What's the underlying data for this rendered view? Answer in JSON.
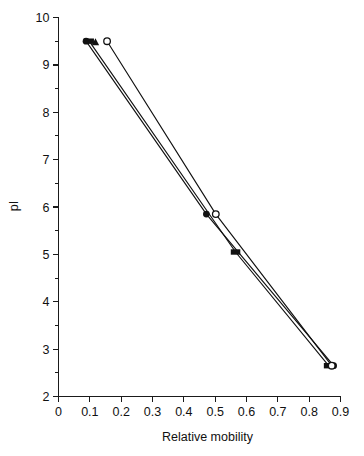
{
  "chart_data": {
    "type": "line",
    "title": "",
    "subtitle": "",
    "xlabel": "Relative mobility",
    "ylabel": "pI",
    "xlim": [
      0,
      0.9
    ],
    "ylim": [
      2,
      10
    ],
    "grid": false,
    "legend": "none",
    "x_ticks": [
      "0",
      "0.1",
      "0.2",
      "0.3",
      "0.4",
      "0.5",
      "0.6",
      "0.7",
      "0.8",
      "0.9"
    ],
    "x_tick_values": [
      0,
      0.1,
      0.2,
      0.3,
      0.4,
      0.5,
      0.6,
      0.7,
      0.8,
      0.9
    ],
    "y_ticks": [
      "2",
      "3",
      "4",
      "5",
      "6",
      "7",
      "8",
      "9",
      "10"
    ],
    "y_tick_values": [
      2,
      3,
      4,
      5,
      6,
      7,
      8,
      9,
      10
    ],
    "y_minor_tick_values": [
      2.5,
      3.5,
      4.5,
      5.5,
      6.5,
      7.5,
      8.5,
      9.5
    ],
    "series": [
      {
        "name": "Series 1",
        "marker": "filled-circle",
        "x": [
          0.088,
          0.472,
          0.878
        ],
        "y": [
          9.5,
          5.85,
          2.65
        ]
      },
      {
        "name": "Series 2",
        "marker": "filled-square",
        "x": [
          0.098,
          0.565,
          0.862
        ],
        "y": [
          9.5,
          5.05,
          2.65
        ]
      },
      {
        "name": "Series 3",
        "marker": "open-circle",
        "x": [
          0.155,
          0.502,
          0.872
        ],
        "y": [
          9.5,
          5.85,
          2.65
        ]
      },
      {
        "name": "Series 4",
        "marker": "filled-triangle",
        "x": [
          0.118
        ],
        "y": [
          9.48
        ]
      }
    ]
  },
  "axes": {
    "x_axis_name": "relative-mobility-axis",
    "y_axis_name": "pi-axis"
  }
}
